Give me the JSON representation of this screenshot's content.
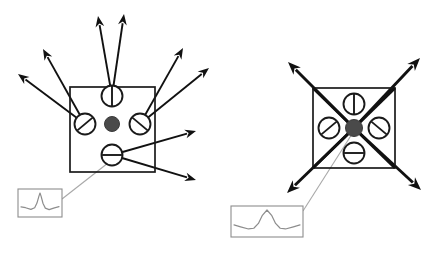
{
  "figure": {
    "background_color": "#ffffff",
    "line_color": "#1a1a1a",
    "inset_color": "#8d8d8d",
    "center_dot_color": "#4a4a4a",
    "width": 431,
    "height": 253
  },
  "panels": [
    {
      "id": "left-panel",
      "name": "left-configuration",
      "box": {
        "x": 70,
        "y": 87,
        "w": 85,
        "h": 85
      },
      "center_dot": {
        "cx": 112,
        "cy": 124,
        "r": 7.5
      },
      "has_diagonals": false,
      "elements": [
        {
          "id": "top",
          "cx": 112,
          "cy": 96,
          "r": 10.5,
          "slot_angle_deg": 90,
          "label": "slotted-element-top"
        },
        {
          "id": "left",
          "cx": 85,
          "cy": 124,
          "r": 10.5,
          "slot_angle_deg": 40,
          "label": "slotted-element-left"
        },
        {
          "id": "right",
          "cx": 140,
          "cy": 124,
          "r": 10.5,
          "slot_angle_deg": 140,
          "label": "slotted-element-right"
        },
        {
          "id": "bottom",
          "cx": 112,
          "cy": 155,
          "r": 10.5,
          "slot_angle_deg": 0,
          "label": "slotted-element-bottom"
        }
      ],
      "ray_pairs": [
        {
          "from": "top",
          "a": [
            98,
            16
          ],
          "b": [
            124,
            14
          ]
        },
        {
          "from": "left",
          "a": [
            43,
            49
          ],
          "b": [
            18,
            74
          ]
        },
        {
          "from": "right",
          "a": [
            183,
            48
          ],
          "b": [
            209,
            68
          ]
        },
        {
          "from": "bottom",
          "a": [
            196,
            131
          ],
          "b": [
            196,
            180
          ]
        }
      ],
      "inset": {
        "x": 18,
        "y": 189,
        "w": 44,
        "h": 28,
        "peak": "narrow-sharp",
        "label": "psf-inset-left",
        "leader": {
          "x1": 108,
          "y1": 163,
          "x2": 62,
          "y2": 199
        }
      }
    },
    {
      "id": "right-panel",
      "name": "right-configuration",
      "box": {
        "x": 313,
        "y": 88,
        "w": 82,
        "h": 80
      },
      "center_dot": {
        "cx": 354,
        "cy": 128,
        "r": 8.5
      },
      "has_diagonals": true,
      "elements": [
        {
          "id": "top",
          "cx": 354,
          "cy": 104,
          "r": 10.5,
          "slot_angle_deg": 90,
          "label": "slotted-element-top"
        },
        {
          "id": "left",
          "cx": 329,
          "cy": 128,
          "r": 10.5,
          "slot_angle_deg": 40,
          "label": "slotted-element-left"
        },
        {
          "id": "right",
          "cx": 379,
          "cy": 128,
          "r": 10.5,
          "slot_angle_deg": 140,
          "label": "slotted-element-right"
        },
        {
          "id": "bottom",
          "cx": 354,
          "cy": 153,
          "r": 10.5,
          "slot_angle_deg": 0,
          "label": "slotted-element-bottom"
        }
      ],
      "diagonal_rays": [
        {
          "dir": "up-left",
          "to": [
            288,
            62
          ]
        },
        {
          "dir": "up-right",
          "to": [
            420,
            58
          ]
        },
        {
          "dir": "down-left",
          "to": [
            287,
            193
          ]
        },
        {
          "dir": "down-right",
          "to": [
            421,
            190
          ]
        }
      ],
      "inset": {
        "x": 231,
        "y": 206,
        "w": 72,
        "h": 31,
        "peak": "broad-with-side-dips",
        "label": "psf-inset-right",
        "leader": {
          "x1": 352,
          "y1": 134,
          "x2": 303,
          "y2": 211
        }
      }
    }
  ],
  "chart_data": {
    "type": "line",
    "xlabel": "",
    "ylabel": "",
    "series": [
      {
        "name": "left-inset-profile",
        "description": "narrow sharp central peak with shallow wings",
        "x": [
          0,
          0.12,
          0.26,
          0.36,
          0.42,
          0.47,
          0.5,
          0.53,
          0.58,
          0.64,
          0.74,
          0.88,
          1
        ],
        "values": [
          0.34,
          0.3,
          0.22,
          0.3,
          0.52,
          0.84,
          1.0,
          0.84,
          0.5,
          0.28,
          0.21,
          0.29,
          0.35
        ]
      },
      {
        "name": "right-inset-profile",
        "description": "broader central peak with shallow side dips",
        "x": [
          0,
          0.1,
          0.22,
          0.3,
          0.37,
          0.43,
          0.5,
          0.57,
          0.63,
          0.7,
          0.78,
          0.9,
          1
        ],
        "values": [
          0.38,
          0.3,
          0.21,
          0.24,
          0.44,
          0.78,
          1.0,
          0.78,
          0.44,
          0.24,
          0.21,
          0.3,
          0.38
        ]
      }
    ],
    "grid": false,
    "legend": "none"
  }
}
